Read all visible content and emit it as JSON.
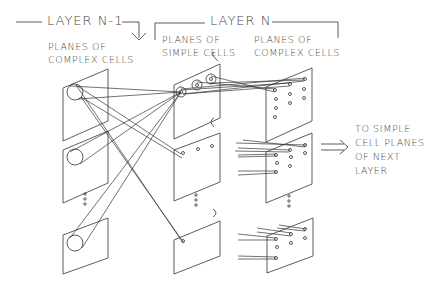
{
  "diagram": {
    "layer_prev": {
      "title": "LAYER N-1",
      "column_label_1": "PLANES OF",
      "column_label_2": "COMPLEX CELLS"
    },
    "layer_curr": {
      "title": "LAYER N",
      "simple": {
        "label_1": "PLANES OF",
        "label_2": "SIMPLE CELLS",
        "planes_marker": "C"
      },
      "complex": {
        "label_1": "PLANES OF",
        "label_2": "COMPLEX CELLS"
      }
    },
    "output": {
      "line_1": "TO SIMPLE",
      "line_2": "CELL PLANES",
      "line_3": "OF NEXT",
      "line_4": "LAYER"
    },
    "ellipsis": "⋮",
    "stroke_color": "#333333"
  }
}
